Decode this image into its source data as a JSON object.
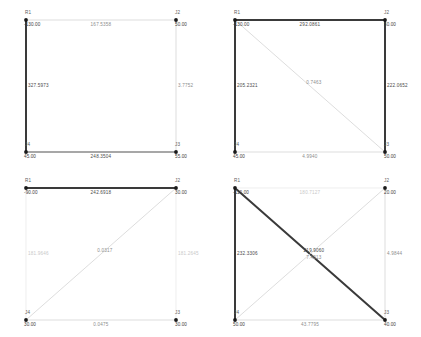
{
  "canvas": {
    "width": 421,
    "height": 337,
    "background": "#ffffff"
  },
  "colors": {
    "member_heavy": "#3a3a3a",
    "member_medium": "#8a8a8a",
    "member_light": "#d2d2d2",
    "member_faint": "#e2e2e2",
    "node_marker": "#1a1a1a",
    "text_dark": "#3d3d3d",
    "text_mid": "#8d8d8d",
    "text_pale": "#c9c9c9"
  },
  "node_labels": {
    "top_left": "R1",
    "top_right": "J2",
    "bottom_right": "J3",
    "bottom_left": "J4"
  },
  "panels": [
    {
      "id": "panel-1",
      "position": "top-left",
      "nodes": {
        "R1": "-130.00",
        "J2": "50.00",
        "J3": "55.00",
        "J4": "45.00"
      },
      "members": {
        "top": {
          "value": "167.5358",
          "weight": "light"
        },
        "left": {
          "value": "327.5973",
          "weight": "heavy"
        },
        "right": {
          "value": "3.7752",
          "weight": "light"
        },
        "bottom": {
          "value": "248.3504",
          "weight": "medium"
        }
      },
      "diagonals": []
    },
    {
      "id": "panel-2",
      "position": "top-right",
      "nodes": {
        "R1": "-130.00",
        "J2": "50.00",
        "J3": "50.00",
        "J4": "45.00"
      },
      "members": {
        "top": {
          "value": "292.0861",
          "weight": "heavy"
        },
        "left": {
          "value": "205.2321",
          "weight": "heavy"
        },
        "right": {
          "value": "222.0652",
          "weight": "heavy"
        },
        "bottom": {
          "value": "4.9940",
          "weight": "light"
        }
      },
      "diagonals": [
        {
          "from": "R1",
          "to": "J3",
          "value": "0.7463",
          "weight": "light"
        }
      ]
    },
    {
      "id": "panel-3",
      "position": "bottom-left",
      "nodes": {
        "R1": "-90.00",
        "J2": "30.00",
        "J3": "30.00",
        "J4": "30.00"
      },
      "members": {
        "top": {
          "value": "242.6918",
          "weight": "heavy"
        },
        "left": {
          "value": "181.9646",
          "weight": "faint"
        },
        "right": {
          "value": "181.2645",
          "weight": "faint"
        },
        "bottom": {
          "value": "0.0475",
          "weight": "light"
        }
      },
      "diagonals": [
        {
          "from": "J4",
          "to": "J2",
          "value": "0.0317",
          "weight": "light"
        }
      ]
    },
    {
      "id": "panel-4",
      "position": "bottom-right",
      "nodes": {
        "R1": "-110.00",
        "J2": "20.00",
        "J3": "40.00",
        "J4": "50.00"
      },
      "members": {
        "top": {
          "value": "180.7127",
          "weight": "faint"
        },
        "left": {
          "value": "232.3306",
          "weight": "heavy"
        },
        "right": {
          "value": "4.9844",
          "weight": "light"
        },
        "bottom": {
          "value": "43.7795",
          "weight": "light"
        }
      },
      "diagonals": [
        {
          "from": "R1",
          "to": "J3",
          "value": "219.9060",
          "weight": "heavy"
        },
        {
          "from": "J4",
          "to": "J2",
          "value": "7.4013",
          "weight": "light"
        }
      ]
    }
  ]
}
